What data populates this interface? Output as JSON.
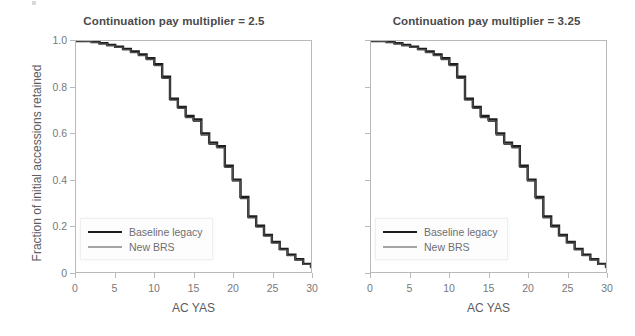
{
  "figure": {
    "background": "#ffffff",
    "shared_ylabel": "Fraction of initial accessions retained",
    "shared_xlabel": "AC YAS"
  },
  "chart_data": [
    {
      "type": "line",
      "panel_index": 0,
      "title": "Continuation pay multiplier = 2.5",
      "xlabel": "AC YAS",
      "ylabel": "Fraction of initial accessions retained",
      "xlim": [
        0,
        30
      ],
      "ylim": [
        0,
        1.0
      ],
      "xticks": [
        0,
        5,
        10,
        15,
        20,
        25,
        30
      ],
      "xticklabels": [
        "0",
        "5",
        "10",
        "15",
        "20",
        "25",
        "30"
      ],
      "yticks": [
        0,
        0.2,
        0.4,
        0.6,
        0.8,
        1.0
      ],
      "yticklabels": [
        "0",
        "0.2",
        "0.4",
        "0.6",
        "0.8",
        "1.0"
      ],
      "grid": false,
      "legend_position": "lower-left",
      "step_style": "post",
      "series": [
        {
          "name": "Baseline legacy",
          "color": "#1d1d1d",
          "linewidth": 2.4,
          "x": [
            0,
            1,
            2,
            3,
            4,
            5,
            6,
            7,
            8,
            9,
            10,
            11,
            12,
            13,
            14,
            15,
            16,
            17,
            18,
            19,
            20,
            21,
            22,
            23,
            24,
            25,
            26,
            27,
            28,
            29,
            30
          ],
          "values": [
            1.0,
            1.0,
            0.995,
            0.99,
            0.983,
            0.975,
            0.966,
            0.955,
            0.942,
            0.925,
            0.9,
            0.845,
            0.75,
            0.715,
            0.675,
            0.66,
            0.6,
            0.56,
            0.545,
            0.46,
            0.4,
            0.325,
            0.24,
            0.2,
            0.16,
            0.13,
            0.1,
            0.075,
            0.055,
            0.035,
            0.018
          ]
        },
        {
          "name": "New BRS",
          "color": "#4c4c4e",
          "linewidth": 1.3,
          "x": [
            0,
            1,
            2,
            3,
            4,
            5,
            6,
            7,
            8,
            9,
            10,
            11,
            12,
            13,
            14,
            15,
            16,
            17,
            18,
            19,
            20,
            21,
            22,
            23,
            24,
            25,
            26,
            27,
            28,
            29,
            30
          ],
          "values": [
            1.0,
            0.999,
            0.994,
            0.988,
            0.98,
            0.972,
            0.962,
            0.95,
            0.937,
            0.92,
            0.893,
            0.838,
            0.744,
            0.708,
            0.668,
            0.652,
            0.593,
            0.553,
            0.538,
            0.453,
            0.393,
            0.318,
            0.234,
            0.194,
            0.155,
            0.125,
            0.096,
            0.071,
            0.052,
            0.033,
            0.016
          ]
        }
      ]
    },
    {
      "type": "line",
      "panel_index": 1,
      "title": "Continuation pay multiplier = 3.25",
      "xlabel": "AC YAS",
      "ylabel": "",
      "xlim": [
        0,
        30
      ],
      "ylim": [
        0,
        1.0
      ],
      "xticks": [
        0,
        5,
        10,
        15,
        20,
        25,
        30
      ],
      "xticklabels": [
        "0",
        "5",
        "10",
        "15",
        "20",
        "25",
        "30"
      ],
      "yticks": [
        0,
        0.2,
        0.4,
        0.6,
        0.8,
        1.0
      ],
      "yticklabels": [
        "",
        "",
        "",
        "",
        "",
        ""
      ],
      "grid": false,
      "legend_position": "lower-left",
      "step_style": "post",
      "series": [
        {
          "name": "Baseline legacy",
          "color": "#1d1d1d",
          "linewidth": 2.4,
          "x": [
            0,
            1,
            2,
            3,
            4,
            5,
            6,
            7,
            8,
            9,
            10,
            11,
            12,
            13,
            14,
            15,
            16,
            17,
            18,
            19,
            20,
            21,
            22,
            23,
            24,
            25,
            26,
            27,
            28,
            29,
            30
          ],
          "values": [
            1.0,
            1.0,
            0.995,
            0.99,
            0.983,
            0.975,
            0.966,
            0.955,
            0.942,
            0.925,
            0.9,
            0.845,
            0.75,
            0.715,
            0.675,
            0.66,
            0.6,
            0.56,
            0.545,
            0.46,
            0.4,
            0.325,
            0.24,
            0.2,
            0.16,
            0.13,
            0.1,
            0.075,
            0.055,
            0.035,
            0.018
          ]
        },
        {
          "name": "New BRS",
          "color": "#4c4c4e",
          "linewidth": 1.3,
          "x": [
            0,
            1,
            2,
            3,
            4,
            5,
            6,
            7,
            8,
            9,
            10,
            11,
            12,
            13,
            14,
            15,
            16,
            17,
            18,
            19,
            20,
            21,
            22,
            23,
            24,
            25,
            26,
            27,
            28,
            29,
            30
          ],
          "values": [
            1.0,
            0.999,
            0.994,
            0.988,
            0.98,
            0.972,
            0.962,
            0.95,
            0.937,
            0.92,
            0.893,
            0.838,
            0.744,
            0.708,
            0.668,
            0.652,
            0.593,
            0.553,
            0.538,
            0.453,
            0.393,
            0.318,
            0.234,
            0.194,
            0.155,
            0.125,
            0.096,
            0.071,
            0.052,
            0.033,
            0.016
          ]
        }
      ]
    }
  ]
}
